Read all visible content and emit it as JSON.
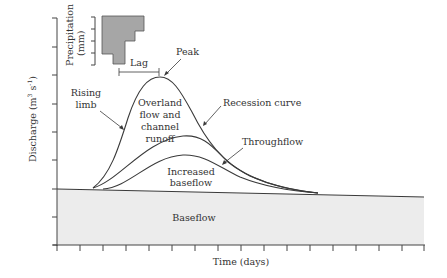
{
  "diagram": {
    "y_axis": {
      "label": "Discharge (m",
      "sup1": "3",
      "mid": " s",
      "sup2": "-1",
      "end": ")"
    },
    "x_axis": {
      "label": "Time (days)"
    },
    "hyetograph": {
      "label_line1": "Precipitation",
      "label_line2": "(mm)"
    },
    "labels": {
      "lag": "Lag",
      "peak": "Peak",
      "rising_limb_1": "Rising",
      "rising_limb_2": "limb",
      "overland_1": "Overland",
      "overland_2": "flow and",
      "overland_3": "channel",
      "overland_4": "runoff",
      "recession": "Recession curve",
      "throughflow": "Throughflow",
      "increased_1": "Increased",
      "increased_2": "baseflow",
      "baseflow": "Baseflow"
    },
    "colors": {
      "baseflow_fill": "#ececec",
      "hyetograph_fill": "#a6a6a6",
      "line": "#3a3a3a"
    }
  }
}
